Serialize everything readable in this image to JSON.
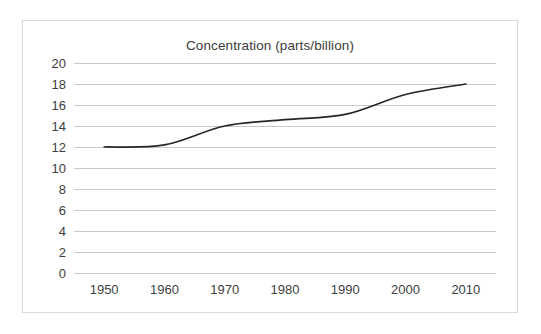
{
  "chart_data": {
    "type": "line",
    "title": "Concentration (parts/billion)",
    "xlabel": "",
    "ylabel": "",
    "x": [
      1950,
      1960,
      1970,
      1980,
      1990,
      2000,
      2010
    ],
    "series": [
      {
        "name": "Concentration",
        "values": [
          12.0,
          12.2,
          14.0,
          14.6,
          15.1,
          17.0,
          18.0
        ],
        "color": "#262626"
      }
    ],
    "xlim": [
      1945,
      2015
    ],
    "ylim": [
      0,
      20
    ],
    "y_ticks": [
      0,
      2,
      4,
      6,
      8,
      10,
      12,
      14,
      16,
      18,
      20
    ],
    "y_tick_labels": [
      "0",
      "2",
      "4",
      "6",
      "8",
      "10",
      "12",
      "14",
      "16",
      "18",
      "20"
    ],
    "x_ticks": [
      1950,
      1960,
      1970,
      1980,
      1990,
      2000,
      2010
    ],
    "x_tick_labels": [
      "1950",
      "1960",
      "1970",
      "1980",
      "1990",
      "2000",
      "2010"
    ],
    "grid": "horizontal",
    "legend": "none",
    "gridline_color": "#c9c9c9",
    "frame_color": "#d9d9d9",
    "background_color": "#ffffff",
    "text_color": "#404040",
    "title_color": "#3b3b3b"
  }
}
